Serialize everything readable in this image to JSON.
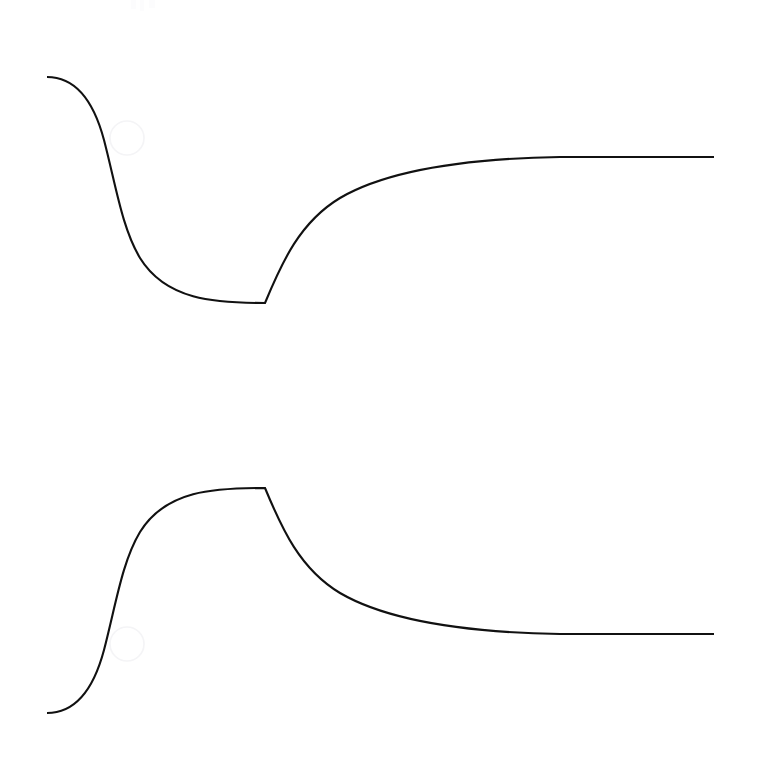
{
  "figure": {
    "background_color": "#ffffff",
    "stroke_color": "#111111",
    "stroke_width": 2.1,
    "cursor_ring_color": "#f4f4f6",
    "faint_mark_color": "#fcfcfd",
    "width": 766,
    "height": 762,
    "title": "",
    "subtitle": "",
    "axes_visible": "none",
    "tick_labels_visible": "none",
    "legend_visible": "none"
  },
  "chart_data": {
    "type": "line",
    "title": "",
    "subtitle": "",
    "xlabel": "",
    "ylabel": "",
    "xlim": [
      47,
      715
    ],
    "ylim": [
      0,
      762
    ],
    "grid": false,
    "legend": "none",
    "axis_visible": false,
    "tick_labels": [],
    "annotations": [],
    "series": [
      {
        "name": "upper-curve",
        "description": "Descends from a high left plateau, falls steeply, flattens to a minimum, turns sharply upward at a cusp, then rises and levels into a high right plateau.",
        "path": "M 47 77 C 72 77 92 95 104 140 C 116 186 122 228 140 258 C 166 300 214 303 265 303 L 265 303 C 282 262 300 222 340 198 C 400 163 500 158 560 157 C 630 157 680 157 714 157",
        "x": [
          47,
          70,
          90,
          104,
          118,
          135,
          160,
          200,
          240,
          265,
          268,
          280,
          300,
          330,
          370,
          420,
          480,
          560,
          640,
          714
        ],
        "y": [
          77,
          77,
          88,
          140,
          200,
          248,
          283,
          298,
          302,
          303,
          288,
          258,
          232,
          208,
          188,
          175,
          166,
          160,
          158,
          157
        ],
        "cusp": {
          "x": 265,
          "y": 303,
          "type": "minimum-corner"
        },
        "left_plateau_y": 77,
        "right_plateau_y": 157
      },
      {
        "name": "lower-curve",
        "description": "Mirror image of the upper curve: rises from a low left baseline, climbs steeply, flattens to a maximum, turns sharply downward at a cusp, then falls and levels into a low right plateau.",
        "path": "M 47 713 C 72 713 92 695 104 650 C 116 604 122 562 140 532 C 166 490 214 488 265 488 L 265 488 C 282 529 300 569 340 593 C 400 628 500 633 560 634 C 630 634 680 634 714 634",
        "x": [
          47,
          70,
          90,
          104,
          118,
          135,
          160,
          200,
          240,
          265,
          268,
          280,
          300,
          330,
          370,
          420,
          480,
          560,
          640,
          714
        ],
        "y": [
          713,
          713,
          702,
          650,
          590,
          542,
          507,
          492,
          489,
          488,
          503,
          532,
          558,
          582,
          602,
          615,
          624,
          630,
          632,
          634
        ],
        "cusp": {
          "x": 265,
          "y": 488,
          "type": "maximum-corner"
        },
        "left_plateau_y": 713,
        "right_plateau_y": 634
      }
    ],
    "markers": [
      {
        "name": "upper-cursor-ring",
        "cx": 127,
        "cy": 138,
        "r": 17
      },
      {
        "name": "lower-cursor-ring",
        "cx": 127,
        "cy": 644,
        "r": 17
      }
    ],
    "faint_marks": [
      {
        "name": "faint-mark-1",
        "x": 131,
        "y": 0,
        "w": 5,
        "h": 9
      },
      {
        "name": "faint-mark-2",
        "x": 140,
        "y": 0,
        "w": 4,
        "h": 11
      },
      {
        "name": "faint-mark-3",
        "x": 149,
        "y": 0,
        "w": 6,
        "h": 8
      }
    ]
  }
}
